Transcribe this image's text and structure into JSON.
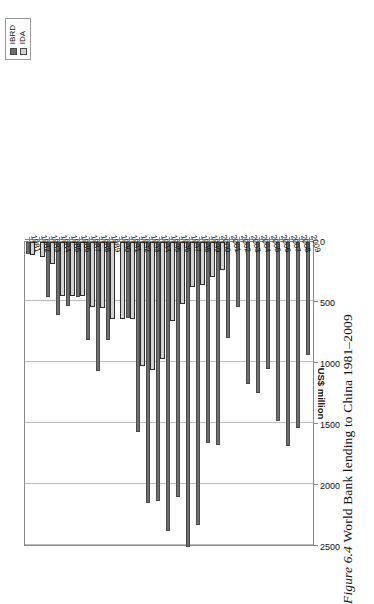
{
  "figure": {
    "number": "Figure 6.4",
    "caption": "World Bank lending to China 1981–2009"
  },
  "legend": {
    "position": "top-right",
    "items": [
      {
        "label": "IBRD",
        "color": "#6e6e6e",
        "key": "legend-key-ibrd"
      },
      {
        "label": "IDA",
        "color": "#d3d3d3",
        "key": "legend-key-ida"
      }
    ]
  },
  "axes": {
    "value_title": "US$ million",
    "value_ticks": [
      "0",
      "500",
      "1000",
      "1500",
      "2000",
      "2500"
    ],
    "value_min": 0,
    "value_max": 2500
  },
  "chart_data": {
    "type": "bar",
    "orientation": "horizontal",
    "title": "World Bank lending to China 1981–2009",
    "xlabel": "US$ million",
    "ylabel": "",
    "xlim": [
      0,
      2500
    ],
    "grid": true,
    "legend_position": "top-right",
    "categories": [
      "1981",
      "1982",
      "1983",
      "1984",
      "1985",
      "1986",
      "1987",
      "1988",
      "1989",
      "1990",
      "1991",
      "1992",
      "1993",
      "1994",
      "1995",
      "1996",
      "1997",
      "1998",
      "1999",
      "2000",
      "2001",
      "2002",
      "2003",
      "2004",
      "2005",
      "2006",
      "2007",
      "2008",
      "2009"
    ],
    "series": [
      {
        "name": "IBRD",
        "color": "#6e6e6e",
        "values": [
          100,
          0,
          450,
          600,
          525,
          450,
          800,
          1060,
          800,
          0,
          620,
          1560,
          2140,
          2120,
          2370,
          2090,
          2500,
          2320,
          1650,
          1660,
          790,
          530,
          1160,
          1240,
          1040,
          1465,
          1670,
          1525,
          930
        ]
      },
      {
        "name": "IDA",
        "color": "#d3d3d3",
        "values": [
          110,
          120,
          180,
          440,
          440,
          440,
          530,
          540,
          630,
          635,
          635,
          1020,
          1050,
          960,
          650,
          510,
          370,
          355,
          290,
          230,
          0,
          0,
          0,
          0,
          0,
          0,
          0,
          0,
          0
        ]
      }
    ]
  }
}
